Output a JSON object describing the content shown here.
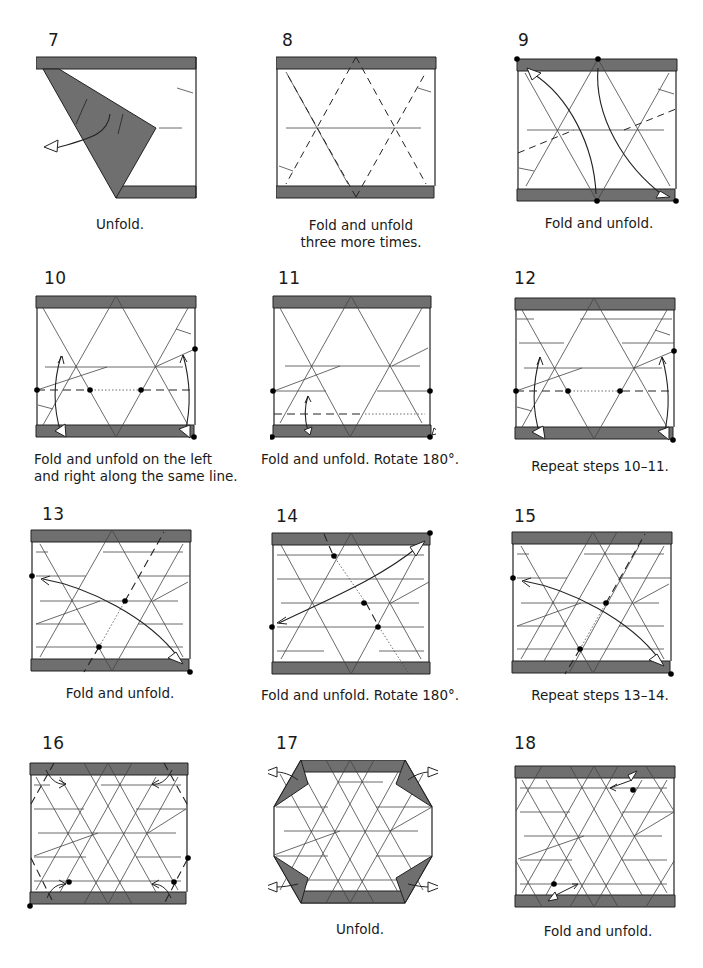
{
  "colors": {
    "strip": "#6f6f6f",
    "line": "#333333",
    "bg": "#ffffff",
    "dot": "#000000"
  },
  "steps": [
    {
      "number": "7",
      "caption": [
        "Unfold."
      ]
    },
    {
      "number": "8",
      "caption": [
        "Fold and unfold",
        "three more times."
      ]
    },
    {
      "number": "9",
      "caption": [
        "Fold and unfold."
      ]
    },
    {
      "number": "10",
      "caption": [
        "Fold and unfold on the left",
        "and right along the same line."
      ]
    },
    {
      "number": "11",
      "caption": [
        "Fold and unfold. Rotate 180°."
      ]
    },
    {
      "number": "12",
      "caption": [
        "Repeat steps 10–11."
      ]
    },
    {
      "number": "13",
      "caption": [
        "Fold and unfold."
      ]
    },
    {
      "number": "14",
      "caption": [
        "Fold and unfold. Rotate 180°."
      ]
    },
    {
      "number": "15",
      "caption": [
        "Repeat steps 13–14."
      ]
    },
    {
      "number": "16",
      "caption": []
    },
    {
      "number": "17",
      "caption": [
        "Unfold."
      ]
    },
    {
      "number": "18",
      "caption": [
        "Fold and unfold."
      ]
    }
  ],
  "icons": {
    "fold_line": "dashed-valley-line",
    "crease_line": "thin-crease-line",
    "arrow": "fold-unfold-arrow",
    "reference_dot": "reference-point-dot"
  }
}
